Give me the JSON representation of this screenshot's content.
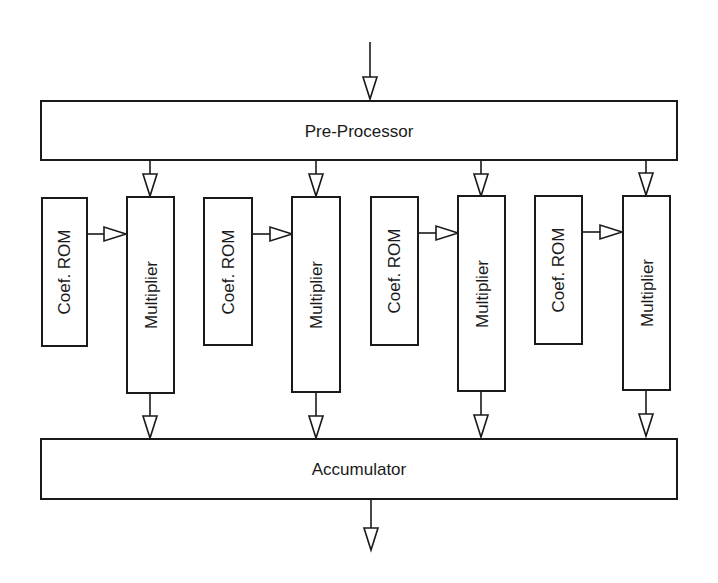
{
  "diagram": {
    "title": "",
    "colors": {
      "stroke": "#1a1a1a",
      "fill": "#ffffff",
      "background": "#ffffff"
    },
    "nodes": {
      "preprocessor": {
        "label": "Pre-Processor"
      },
      "accumulator": {
        "label": "Accumulator"
      },
      "lanes": [
        {
          "rom_label": "Coef. ROM",
          "mult_label": "Multiplier"
        },
        {
          "rom_label": "Coef. ROM",
          "mult_label": "Multiplier"
        },
        {
          "rom_label": "Coef. ROM",
          "mult_label": "Multiplier"
        },
        {
          "rom_label": "Coef. ROM",
          "mult_label": "Multiplier"
        }
      ]
    },
    "edges": [
      {
        "from": "input",
        "to": "preprocessor"
      },
      {
        "from": "preprocessor",
        "to": "multiplier-1"
      },
      {
        "from": "preprocessor",
        "to": "multiplier-2"
      },
      {
        "from": "preprocessor",
        "to": "multiplier-3"
      },
      {
        "from": "preprocessor",
        "to": "multiplier-4"
      },
      {
        "from": "coef-rom-1",
        "to": "multiplier-1"
      },
      {
        "from": "coef-rom-2",
        "to": "multiplier-2"
      },
      {
        "from": "coef-rom-3",
        "to": "multiplier-3"
      },
      {
        "from": "coef-rom-4",
        "to": "multiplier-4"
      },
      {
        "from": "multiplier-1",
        "to": "accumulator"
      },
      {
        "from": "multiplier-2",
        "to": "accumulator"
      },
      {
        "from": "multiplier-3",
        "to": "accumulator"
      },
      {
        "from": "multiplier-4",
        "to": "accumulator"
      },
      {
        "from": "accumulator",
        "to": "output"
      }
    ]
  }
}
